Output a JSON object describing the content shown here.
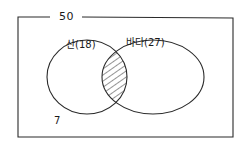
{
  "diagram": {
    "type": "venn",
    "universe": {
      "label": "50",
      "value": 50
    },
    "sets": [
      {
        "id": "A",
        "label": "산(18)",
        "name": "산",
        "value": 18
      },
      {
        "id": "B",
        "label": "바다(27)",
        "name": "바다",
        "value": 27
      }
    ],
    "outside": {
      "label": "7",
      "value": 7
    },
    "intersection": {
      "shaded": true,
      "pattern": "diagonal-hatch"
    },
    "colors": {
      "stroke": "#2a2a2a",
      "background": "#ffffff"
    }
  }
}
